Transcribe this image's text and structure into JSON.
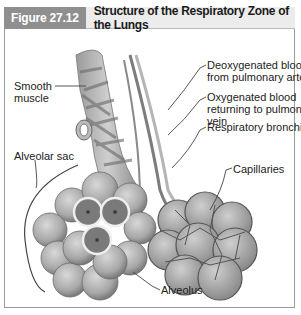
{
  "figure": {
    "number": "Figure 27.12",
    "title": "Structure of the Respiratory Zone of the Lungs"
  },
  "labels": {
    "deoxygenated_line1": "Deoxygenated blood",
    "deoxygenated_line2": "from pulmonary artery",
    "oxygenated_line1": "Oxygenated blood",
    "oxygenated_line2": "returning to pulmonary",
    "oxygenated_line3": "vein",
    "respiratory_bronchiole": "Respiratory bronchiole",
    "capillaries": "Capillaries",
    "smooth_muscle_line1": "Smooth",
    "smooth_muscle_line2": "muscle",
    "alveolar_sac": "Alveolar sac",
    "alveolus": "Alveolus"
  },
  "colors": {
    "header_number_bg": "#8f8f8f",
    "header_title_bg": "#ececec",
    "border": "#9a9a9a"
  }
}
